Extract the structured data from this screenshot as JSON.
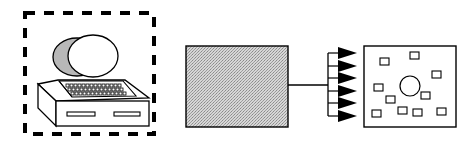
{
  "diagram": {
    "type": "block-flow",
    "nodes": [
      {
        "id": "computer",
        "label": "",
        "icon": "desktop-computer-icon",
        "border": "dashed"
      },
      {
        "id": "processor",
        "label": "",
        "fill": "stippled-gray"
      },
      {
        "id": "output-field",
        "label": "",
        "contents": "one circle and eleven small squares"
      }
    ],
    "edges": [
      {
        "from": "processor",
        "to": "output-field",
        "style": "single line fanning out to six arrows",
        "arrow_count": 6
      }
    ],
    "colors": {
      "stroke": "#000000",
      "gray_fill": "#bdbdbd",
      "background": "#ffffff"
    }
  }
}
